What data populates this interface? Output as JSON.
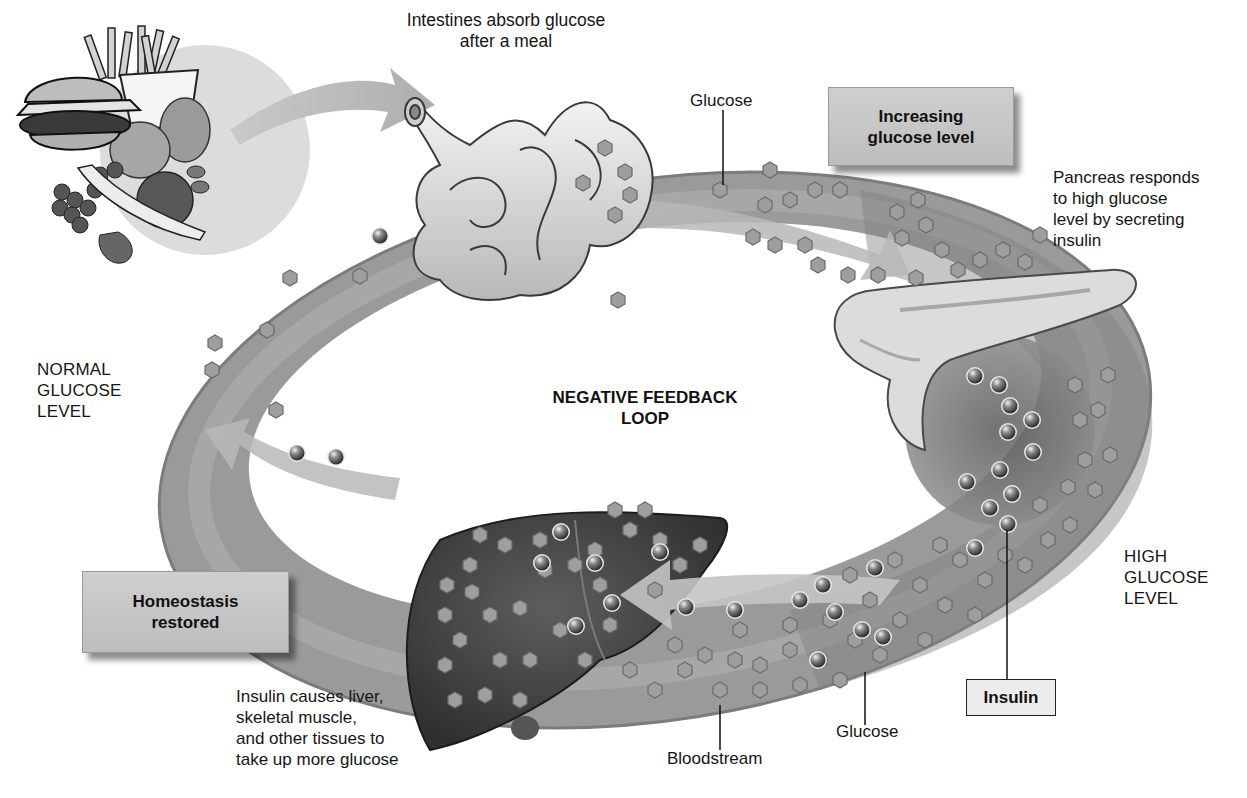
{
  "diagram": {
    "title": "NEGATIVE FEEDBACK LOOP",
    "title_lines": [
      "NEGATIVE FEEDBACK",
      "LOOP"
    ],
    "type": "feedback-loop",
    "colors": {
      "ring": "#8f8f8f",
      "ring_highlight": "#b5b5b5",
      "box_fill": "#c6c6c6",
      "liver": "#4a4a4a",
      "pancreas": "#d8d8d8",
      "glucose_hex": "#9c9c9c",
      "insulin_sphere": "#5c5c5c"
    }
  },
  "labels": {
    "intestines": [
      "Intestines absorb glucose",
      "after a meal"
    ],
    "glucose_top": "Glucose",
    "increasing_box": [
      "Increasing",
      "glucose level"
    ],
    "pancreas": [
      "Pancreas responds",
      "to high glucose",
      "level by secreting",
      "insulin"
    ],
    "normal_level": [
      "NORMAL",
      "GLUCOSE",
      "LEVEL"
    ],
    "high_level": [
      "HIGH",
      "GLUCOSE",
      "LEVEL"
    ],
    "homeostasis_box": [
      "Homeostasis",
      "restored"
    ],
    "liver_caption": [
      "Insulin causes liver,",
      "skeletal muscle,",
      "and other tissues to",
      "take up more glucose"
    ],
    "bloodstream": "Bloodstream",
    "glucose_bottom": "Glucose",
    "insulin_box": "Insulin"
  },
  "nodes": [
    {
      "id": "food",
      "label": "Meal (burger, fries, fruit)"
    },
    {
      "id": "intestines",
      "label": "Intestines"
    },
    {
      "id": "pancreas",
      "label": "Pancreas"
    },
    {
      "id": "liver",
      "label": "Liver"
    }
  ],
  "edges": [
    {
      "from": "food",
      "to": "intestines"
    },
    {
      "from": "intestines",
      "to": "pancreas",
      "label": "Increasing glucose level"
    },
    {
      "from": "pancreas",
      "to": "liver",
      "label": "Insulin"
    },
    {
      "from": "liver",
      "to": "intestines",
      "label": "Homeostasis restored"
    }
  ]
}
